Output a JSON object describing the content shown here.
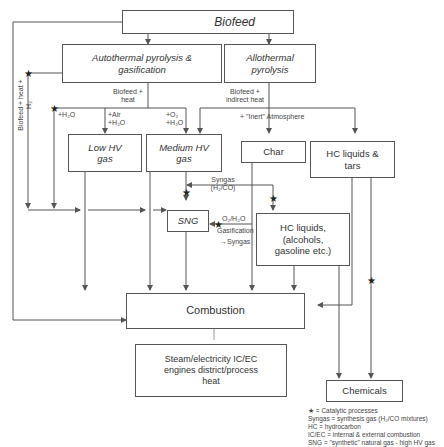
{
  "nodes": {
    "biofeed": "Biofeed",
    "autothermal": "Autothermal pyrolysis & gasification",
    "allothermal": "Allothermal pyrolysis",
    "low_hv_gas": "Low HV gas",
    "medium_hv_gas": "Medium HV gas",
    "char": "Char",
    "hc_liquids_tars": "HC liquids & tars",
    "sng": "SNG",
    "hc_liquids_alcohols": "HC liquids, (alcohols, gasoline etc.)",
    "combustion": "Combustion",
    "steam_electricity": "Steam/electricity IC/EC engines district/process heat",
    "chemicals": "Chemicals"
  },
  "edge_labels": {
    "biofeed_heat_auto": "Biofeed + heat",
    "biofeed_indirect_heat": "Biofeed + indirect heat",
    "inert_atmosphere": "+ \"Inert\"  Atmosphere",
    "h2o": "+H₂O",
    "air_h2o": "+Air +H₂O",
    "o2_h2o": "+O₂ +H₂O",
    "syngas": "Syngas (H₂/CO)",
    "o2_h2o_gasification": "O₂/H₂O",
    "gasification": "Gasification",
    "to_syngas": "→Syngas",
    "biofeed_heat_h2": "Biofeed + heat + H₂"
  },
  "legend": {
    "catalytic": "★ = Catalytic processes",
    "syngas_def": "Syngas = synthesis gas (H₂/CO mixtures)",
    "hc_def": "HC = hydrocarbon",
    "icec_def": "IC/EC = internal & external combustion",
    "sng_def": "SNG = \"synthetic\" natural gas - high HV gas"
  },
  "colors": {
    "line": "#555555",
    "text": "#333333",
    "background": "#ffffff"
  }
}
